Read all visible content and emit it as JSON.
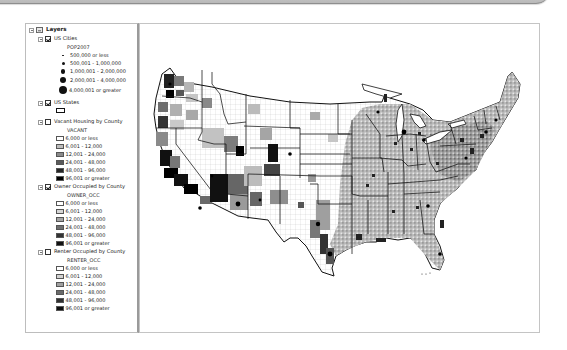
{
  "toc": {
    "root_label": "Layers",
    "layers": [
      {
        "name": "US Cities",
        "checked": true,
        "field": "POP2007",
        "classes": [
          {
            "label": "500,000 or less",
            "size": 1.6
          },
          {
            "label": "500,001 - 1,000,000",
            "size": 3.2
          },
          {
            "label": "1,000,001 - 2,000,000",
            "size": 4.6
          },
          {
            "label": "2,000,001 - 4,000,000",
            "size": 6.0
          },
          {
            "label": "4,000,001 or greater",
            "size": 8.0
          }
        ]
      },
      {
        "name": "US States",
        "checked": true
      },
      {
        "name": "Vacant Housing by County",
        "checked": false,
        "field": "VACANT",
        "classes": [
          {
            "label": "6,000 or less",
            "color": "#ffffff"
          },
          {
            "label": "6,001 - 12,000",
            "color": "#bdbdbd"
          },
          {
            "label": "12,001 - 24,000",
            "color": "#8a8a8a"
          },
          {
            "label": "24,001 - 48,000",
            "color": "#5a5a5a"
          },
          {
            "label": "48,001 - 96,000",
            "color": "#262626"
          },
          {
            "label": "96,001 or greater",
            "color": "#000000"
          }
        ]
      },
      {
        "name": "Owner Occupied by County",
        "checked": true,
        "field": "OWNER_OCC",
        "classes": [
          {
            "label": "6,000 or less",
            "color": "#ffffff"
          },
          {
            "label": "6,001 - 12,000",
            "color": "#d6d6d6"
          },
          {
            "label": "12,001 - 24,000",
            "color": "#a5a5a5"
          },
          {
            "label": "24,001 - 48,000",
            "color": "#6e6e6e"
          },
          {
            "label": "48,001 - 96,000",
            "color": "#333333"
          },
          {
            "label": "96,001 or greater",
            "color": "#111111"
          }
        ]
      },
      {
        "name": "Renter Occupied by County",
        "checked": false,
        "field": "RENTER_OCC",
        "classes": [
          {
            "label": "6,000 or less",
            "color": "#ffffff"
          },
          {
            "label": "6,001 - 12,000",
            "color": "#d2d2d2"
          },
          {
            "label": "12,001 - 24,000",
            "color": "#a0a0a0"
          },
          {
            "label": "24,001 - 48,000",
            "color": "#6a6a6a"
          },
          {
            "label": "48,001 - 96,000",
            "color": "#303030"
          },
          {
            "label": "96,001 or greater",
            "color": "#0e0e0e"
          }
        ]
      }
    ]
  },
  "map": {
    "subject": "Contiguous United States choropleth of owner occupied housing units by county, with state boundaries and city points",
    "colors": {
      "background": "#ffffff",
      "state_outline": "#111111",
      "county_outline": "#9a9a9a"
    }
  }
}
